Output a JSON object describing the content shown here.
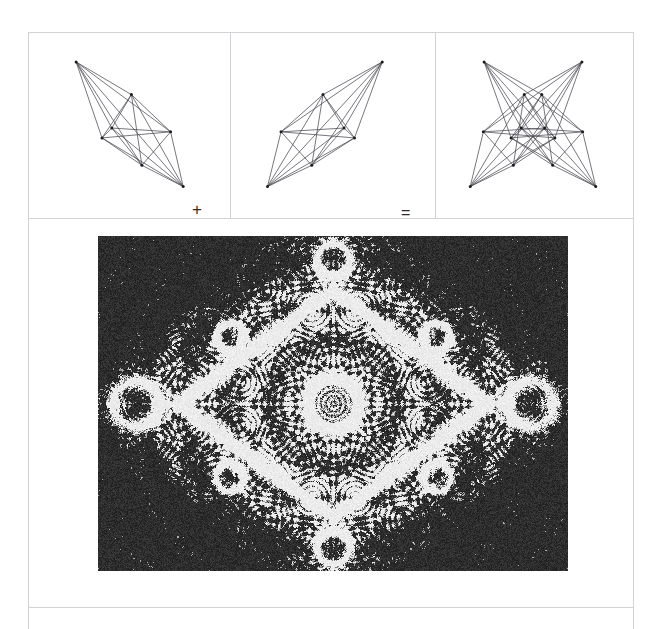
{
  "page": {
    "background_color": "#ffffff",
    "width": 661,
    "height": 629,
    "top_clipped_text": "plate caption"
  },
  "figure": {
    "frame_color": "#d2d2d6",
    "caption_visible": false
  },
  "equation_row": {
    "operators": {
      "plus": "+",
      "equals": "="
    },
    "panels": [
      {
        "id": "panel-left",
        "name": "first-lattice-graph",
        "description": "complete graph on 7 vertices, elongated diamond tilted down-right",
        "line_color": "#4a4a52",
        "node_color": "#1c1c20"
      },
      {
        "id": "panel-middle",
        "name": "second-lattice-graph",
        "description": "mirror image complete graph on 7 vertices, elongated diamond tilted down-left",
        "line_color": "#4a4a52",
        "node_color": "#1c1c20"
      },
      {
        "id": "panel-right",
        "name": "superposed-lattice-graph",
        "description": "superposition of the two graphs forming a four pointed star",
        "line_color": "#4a4a52",
        "node_color": "#1c1c20"
      }
    ]
  },
  "moire_plate": {
    "name": "moire-interference-photograph",
    "description": "halftone photograph of a moire interference pattern with concentric ring nodes",
    "background_color": "#1d1d1d",
    "highlight_color": "#f2f2f2",
    "width": 470,
    "height": 335,
    "center_node": {
      "x": 0.5,
      "y": 0.5,
      "radius": 0.06
    },
    "major_nodes": [
      {
        "x": 0.08,
        "y": 0.5,
        "radius": 0.05
      },
      {
        "x": 0.92,
        "y": 0.5,
        "radius": 0.05
      },
      {
        "x": 0.5,
        "y": 0.07,
        "radius": 0.035
      },
      {
        "x": 0.5,
        "y": 0.93,
        "radius": 0.035
      },
      {
        "x": 0.28,
        "y": 0.3,
        "radius": 0.03
      },
      {
        "x": 0.72,
        "y": 0.3,
        "radius": 0.03
      },
      {
        "x": 0.28,
        "y": 0.72,
        "radius": 0.03
      },
      {
        "x": 0.72,
        "y": 0.72,
        "radius": 0.03
      }
    ]
  },
  "chart_data": {
    "type": "diagram",
    "title": "",
    "series": [
      {
        "name": "first-graph-vertices",
        "points": [
          [
            0.165,
            0.085
          ],
          [
            0.56,
            0.3
          ],
          [
            0.84,
            0.545
          ],
          [
            0.35,
            0.585
          ],
          [
            0.635,
            0.765
          ],
          [
            0.93,
            0.905
          ],
          [
            0.42,
            0.52
          ]
        ]
      },
      {
        "name": "second-graph-vertices",
        "points": [
          [
            0.835,
            0.085
          ],
          [
            0.44,
            0.3
          ],
          [
            0.16,
            0.545
          ],
          [
            0.65,
            0.585
          ],
          [
            0.365,
            0.765
          ],
          [
            0.07,
            0.905
          ],
          [
            0.58,
            0.52
          ]
        ]
      }
    ]
  }
}
